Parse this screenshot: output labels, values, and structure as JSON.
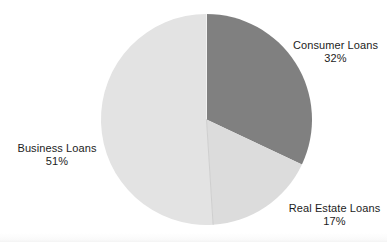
{
  "chart_data": {
    "type": "pie",
    "title": "",
    "labels": [
      "Consumer Loans",
      "Real Estate Loans",
      "Business Loans"
    ],
    "values": [
      32,
      17,
      51
    ],
    "value_suffix": "%",
    "slices": [
      {
        "name": "Consumer Loans",
        "value": 32,
        "value_text": "32%",
        "color": "#808080",
        "start_angle_deg": 0,
        "end_angle_deg": 115.2,
        "label_position": "right-top"
      },
      {
        "name": "Real Estate Loans",
        "value": 17,
        "value_text": "17%",
        "color": "#dcdcdc",
        "start_angle_deg": 115.2,
        "end_angle_deg": 176.4,
        "label_position": "right-bottom"
      },
      {
        "name": "Business Loans",
        "value": 51,
        "value_text": "51%",
        "color": "#e3e3e3",
        "start_angle_deg": 176.4,
        "end_angle_deg": 360,
        "label_position": "left-middle"
      }
    ],
    "start_angle_deg": 0,
    "direction": "clockwise",
    "legend": "none",
    "labels_inline": true,
    "grid": false,
    "background_color": "#ffffff",
    "total": 100
  },
  "geometry": {
    "center_x": 206.5,
    "center_y": 119.5,
    "radius": 105.5
  }
}
